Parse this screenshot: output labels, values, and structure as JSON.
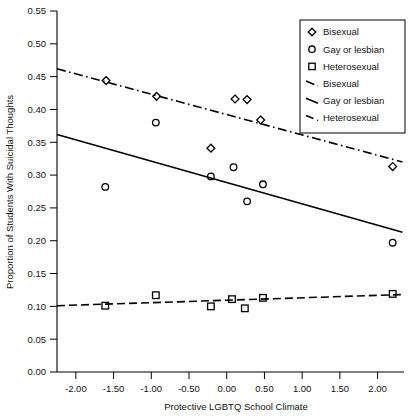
{
  "chart_data": {
    "type": "scatter",
    "title": "",
    "xlabel": "Protective LGBTQ School Climate",
    "ylabel": "Proportion of Students With Suicidal Thoughts",
    "xlim": [
      -2.25,
      2.35
    ],
    "ylim": [
      0.0,
      0.55
    ],
    "xticks": [
      -2.0,
      -1.5,
      -1.0,
      -0.5,
      0.0,
      0.5,
      1.0,
      1.5,
      2.0
    ],
    "xtick_labels": [
      "-2.00",
      "-1.50",
      "-1.00",
      "-0.50",
      "0.00",
      "0.50",
      "1.00",
      "1.50",
      "2.00"
    ],
    "yticks": [
      0.0,
      0.05,
      0.1,
      0.15,
      0.2,
      0.25,
      0.3,
      0.35,
      0.4,
      0.45,
      0.5,
      0.55
    ],
    "ytick_labels": [
      "0.00",
      "0.05",
      "0.10",
      "0.15",
      "0.20",
      "0.25",
      "0.30",
      "0.35",
      "0.40",
      "0.45",
      "0.50",
      "0.55"
    ],
    "grid": false,
    "legend_position": "top-right",
    "series": [
      {
        "name": "Bisexual",
        "marker": "diamond",
        "line_style": "dashdot",
        "points": [
          {
            "x": -1.6,
            "y": 0.444
          },
          {
            "x": -0.93,
            "y": 0.42
          },
          {
            "x": -0.21,
            "y": 0.341
          },
          {
            "x": 0.11,
            "y": 0.416
          },
          {
            "x": 0.27,
            "y": 0.415
          },
          {
            "x": 0.45,
            "y": 0.384
          },
          {
            "x": 2.2,
            "y": 0.313
          }
        ],
        "fit": {
          "x0": -2.25,
          "y0": 0.462,
          "x1": 2.33,
          "y1": 0.32
        }
      },
      {
        "name": "Gay or lesbian",
        "marker": "circle",
        "line_style": "solid",
        "points": [
          {
            "x": -1.61,
            "y": 0.282
          },
          {
            "x": -0.94,
            "y": 0.38
          },
          {
            "x": -0.21,
            "y": 0.298
          },
          {
            "x": 0.09,
            "y": 0.312
          },
          {
            "x": 0.27,
            "y": 0.26
          },
          {
            "x": 0.48,
            "y": 0.286
          },
          {
            "x": 2.2,
            "y": 0.197
          }
        ],
        "fit": {
          "x0": -2.25,
          "y0": 0.362,
          "x1": 2.33,
          "y1": 0.213
        }
      },
      {
        "name": "Heterosexual",
        "marker": "square",
        "line_style": "dashed",
        "points": [
          {
            "x": -1.61,
            "y": 0.101
          },
          {
            "x": -0.94,
            "y": 0.117
          },
          {
            "x": -0.21,
            "y": 0.1
          },
          {
            "x": 0.07,
            "y": 0.111
          },
          {
            "x": 0.24,
            "y": 0.097
          },
          {
            "x": 0.48,
            "y": 0.113
          },
          {
            "x": 2.2,
            "y": 0.119
          }
        ],
        "fit": {
          "x0": -2.25,
          "y0": 0.101,
          "x1": 2.33,
          "y1": 0.118
        }
      }
    ],
    "legend_entries": [
      {
        "label": "Bisexual",
        "kind": "marker",
        "marker": "diamond"
      },
      {
        "label": "Gay or lesbian",
        "kind": "marker",
        "marker": "circle"
      },
      {
        "label": "Heterosexual",
        "kind": "marker",
        "marker": "square"
      },
      {
        "label": "Bisexual",
        "kind": "line",
        "line_style": "dashdot"
      },
      {
        "label": "Gay or lesbian",
        "kind": "line",
        "line_style": "solid"
      },
      {
        "label": "Heterosexual",
        "kind": "line",
        "line_style": "dashed"
      }
    ]
  },
  "colors": {
    "ink": "#000000",
    "background": "#ffffff"
  }
}
